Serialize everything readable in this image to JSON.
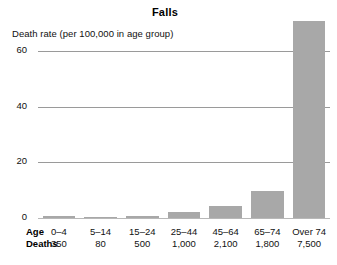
{
  "chart_data": {
    "type": "bar",
    "title": "Falls",
    "ylabel": "Death rate (per 100,000 in age group)",
    "xlabel": "Age",
    "categories": [
      "0–4",
      "5–14",
      "15–24",
      "25–44",
      "45–64",
      "65–74",
      "Over 74"
    ],
    "values": [
      0.6,
      0.3,
      0.8,
      2.0,
      4.3,
      9.8,
      71.0
    ],
    "ylim": [
      0,
      72
    ],
    "yticks": [
      0,
      20,
      40,
      60
    ],
    "ytick_labels": [
      "0",
      "20",
      "40",
      "60"
    ],
    "grid": true,
    "legend": false,
    "bar_color": "#a8a8a8",
    "table": {
      "row_labels": [
        "Age",
        "Deaths"
      ],
      "rows": [
        [
          "0–4",
          "5–14",
          "15–24",
          "25–44",
          "45–64",
          "65–74",
          "Over 74"
        ],
        [
          "350",
          "80",
          "500",
          "1,000",
          "2,100",
          "1,800",
          "7,500"
        ]
      ]
    }
  },
  "chart": {
    "title": "Falls",
    "y_caption": "Death rate (per 100,000 in age group)"
  }
}
